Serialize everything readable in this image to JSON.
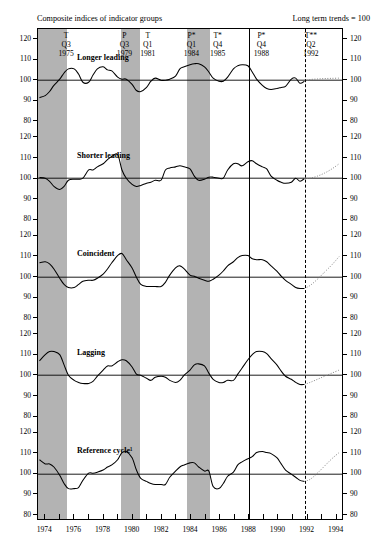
{
  "header": {
    "title_left": "Composite indices of indicator groups",
    "title_right": "Long term trends = 100"
  },
  "turning_points": [
    {
      "code": "T",
      "quarter": "Q3",
      "year": "1975",
      "x": 1975.5
    },
    {
      "code": "P",
      "quarter": "Q3",
      "year": "1979",
      "x": 1979.5
    },
    {
      "code": "T",
      "quarter": "Q1",
      "year": "1981",
      "x": 1981.1
    },
    {
      "code": "P*",
      "quarter": "Q1",
      "year": "1984",
      "x": 1984.1
    },
    {
      "code": "T*",
      "quarter": "Q4",
      "year": "1985",
      "x": 1985.9
    },
    {
      "code": "P*",
      "quarter": "Q4",
      "year": "1988",
      "x": 1988.9
    },
    {
      "code": "T**",
      "quarter": "Q2",
      "year": "1992",
      "x": 1992.3
    }
  ],
  "chart_data": {
    "type": "line",
    "title": "Composite indices of indicator groups",
    "subtitle": "Long term trends = 100",
    "xlabel": "",
    "ylabel": "",
    "xlim": [
      1973.5,
      1994.5
    ],
    "ylim": [
      80,
      120
    ],
    "yticks": [
      80,
      90,
      100,
      110,
      120
    ],
    "xticks": [
      1974,
      1975,
      1976,
      1977,
      1978,
      1979,
      1980,
      1981,
      1982,
      1983,
      1984,
      1985,
      1986,
      1987,
      1988,
      1989,
      1990,
      1991,
      1992,
      1993,
      1994
    ],
    "xtick_labels": [
      "1974",
      "1976",
      "1978",
      "1980",
      "1982",
      "1984",
      "1986",
      "1988",
      "1990",
      "1992",
      "1994"
    ],
    "xtick_label_values": [
      1974,
      1976,
      1978,
      1980,
      1982,
      1984,
      1986,
      1988,
      1990,
      1992,
      1994
    ],
    "grid": false,
    "reference_level": 100,
    "legend": "none",
    "recession_bands": [
      {
        "start": 1973.5,
        "end": 1975.5
      },
      {
        "start": 1979.2,
        "end": 1980.5
      },
      {
        "start": 1983.7,
        "end": 1985.3
      }
    ],
    "markers": {
      "solid_vline": 1988.0,
      "dashed_vline": 1991.85
    },
    "series": [
      {
        "name": "Longer leading",
        "x": [
          1973.6,
          1974.0,
          1974.3,
          1974.6,
          1975.0,
          1975.3,
          1975.6,
          1976.0,
          1976.3,
          1976.6,
          1977.0,
          1977.3,
          1977.6,
          1978.0,
          1978.3,
          1978.6,
          1979.0,
          1979.3,
          1979.6,
          1980.0,
          1980.3,
          1980.6,
          1981.0,
          1981.3,
          1981.6,
          1982.0,
          1982.3,
          1982.6,
          1983.0,
          1983.3,
          1983.6,
          1984.0,
          1984.3,
          1984.6,
          1985.0,
          1985.3,
          1985.6,
          1986.0,
          1986.3,
          1986.6,
          1987.0,
          1987.3,
          1987.6,
          1988.0,
          1988.3,
          1988.6,
          1989.0,
          1989.3,
          1989.6,
          1990.0,
          1990.3,
          1990.6,
          1991.0,
          1991.3,
          1991.6,
          1991.9
        ],
        "values": [
          91.5,
          92.5,
          94.5,
          97.5,
          100.5,
          103.5,
          105.5,
          105.5,
          103.0,
          99.0,
          99.0,
          102.5,
          105.5,
          106.5,
          105.0,
          104.5,
          101.5,
          100.5,
          100.5,
          98.0,
          95.0,
          94.5,
          96.5,
          99.5,
          101.0,
          100.0,
          100.0,
          100.5,
          102.0,
          105.5,
          106.5,
          107.5,
          108.0,
          108.0,
          106.5,
          104.0,
          101.0,
          99.5,
          99.5,
          101.5,
          105.5,
          107.0,
          107.5,
          107.0,
          104.0,
          100.5,
          97.5,
          96.0,
          95.5,
          96.0,
          96.5,
          97.0,
          100.5,
          101.0,
          98.5,
          99.5
        ],
        "projection_x": [
          1991.9,
          1992.3,
          1992.8,
          1993.3,
          1993.8,
          1994.3
        ],
        "projection_values": [
          99.5,
          100.3,
          100.6,
          100.8,
          100.9,
          101.0
        ],
        "panel": 0
      },
      {
        "name": "Shorter leading",
        "x": [
          1973.6,
          1974.0,
          1974.3,
          1974.6,
          1975.0,
          1975.3,
          1975.6,
          1976.0,
          1976.3,
          1976.6,
          1977.0,
          1977.3,
          1977.6,
          1978.0,
          1978.3,
          1978.6,
          1979.0,
          1979.3,
          1979.6,
          1980.0,
          1980.3,
          1980.6,
          1981.0,
          1981.3,
          1981.6,
          1982.0,
          1982.3,
          1982.6,
          1983.0,
          1983.3,
          1983.6,
          1984.0,
          1984.3,
          1984.6,
          1985.0,
          1985.3,
          1985.6,
          1986.0,
          1986.3,
          1986.6,
          1987.0,
          1987.3,
          1987.6,
          1988.0,
          1988.3,
          1988.6,
          1989.0,
          1989.3,
          1989.6,
          1990.0,
          1990.3,
          1990.6,
          1991.0,
          1991.3,
          1991.6,
          1991.9
        ],
        "values": [
          100.3,
          100.0,
          98.5,
          96.0,
          94.5,
          96.0,
          99.0,
          99.5,
          99.5,
          100.0,
          104.0,
          104.0,
          105.5,
          107.0,
          109.0,
          110.5,
          111.5,
          104.0,
          100.0,
          97.0,
          96.0,
          96.5,
          97.5,
          98.0,
          99.0,
          99.0,
          104.0,
          105.0,
          105.5,
          106.0,
          105.5,
          104.5,
          101.0,
          99.0,
          99.5,
          100.5,
          100.5,
          100.0,
          100.0,
          104.0,
          107.0,
          107.0,
          106.0,
          108.0,
          108.5,
          107.0,
          105.5,
          104.5,
          101.0,
          99.0,
          98.0,
          97.5,
          98.0,
          100.0,
          98.5,
          99.8
        ],
        "projection_x": [
          1991.9,
          1992.3,
          1992.8,
          1993.3,
          1993.8,
          1994.3
        ],
        "projection_values": [
          99.8,
          100.0,
          101.0,
          102.5,
          104.5,
          107.0
        ],
        "panel": 1
      },
      {
        "name": "Coincident",
        "x": [
          1973.6,
          1974.0,
          1974.3,
          1974.6,
          1975.0,
          1975.3,
          1975.6,
          1976.0,
          1976.3,
          1976.6,
          1977.0,
          1977.3,
          1977.6,
          1978.0,
          1978.3,
          1978.6,
          1979.0,
          1979.3,
          1979.6,
          1980.0,
          1980.3,
          1980.6,
          1981.0,
          1981.3,
          1981.6,
          1982.0,
          1982.3,
          1982.6,
          1983.0,
          1983.3,
          1983.6,
          1984.0,
          1984.3,
          1984.6,
          1985.0,
          1985.3,
          1985.6,
          1986.0,
          1986.3,
          1986.6,
          1987.0,
          1987.3,
          1987.6,
          1988.0,
          1988.3,
          1988.6,
          1989.0,
          1989.3,
          1989.6,
          1990.0,
          1990.3,
          1990.6,
          1991.0,
          1991.3,
          1991.6,
          1991.9
        ],
        "values": [
          107.0,
          107.5,
          106.5,
          104.0,
          99.5,
          96.5,
          95.0,
          95.0,
          96.5,
          98.0,
          98.5,
          98.5,
          99.5,
          101.5,
          104.0,
          107.0,
          110.5,
          111.5,
          108.5,
          104.5,
          100.0,
          96.5,
          95.5,
          95.5,
          95.5,
          95.5,
          97.5,
          101.0,
          104.5,
          105.5,
          104.0,
          101.0,
          100.5,
          99.5,
          98.5,
          98.0,
          99.0,
          101.0,
          103.0,
          105.5,
          107.5,
          109.5,
          110.5,
          110.5,
          109.0,
          108.5,
          108.5,
          107.5,
          105.5,
          103.0,
          100.5,
          98.5,
          96.5,
          95.0,
          94.5,
          94.5
        ],
        "projection_x": [
          1991.9,
          1992.3,
          1992.8,
          1993.3,
          1993.8,
          1994.3
        ],
        "projection_values": [
          94.5,
          96.0,
          99.0,
          102.5,
          106.0,
          110.0
        ],
        "panel": 2
      },
      {
        "name": "Lagging",
        "x": [
          1973.6,
          1974.0,
          1974.3,
          1974.6,
          1975.0,
          1975.3,
          1975.6,
          1976.0,
          1976.3,
          1976.6,
          1977.0,
          1977.3,
          1977.6,
          1978.0,
          1978.3,
          1978.6,
          1979.0,
          1979.3,
          1979.6,
          1980.0,
          1980.3,
          1980.6,
          1981.0,
          1981.3,
          1981.6,
          1982.0,
          1982.3,
          1982.6,
          1983.0,
          1983.3,
          1983.6,
          1984.0,
          1984.3,
          1984.6,
          1985.0,
          1985.3,
          1985.6,
          1986.0,
          1986.3,
          1986.6,
          1987.0,
          1987.3,
          1987.6,
          1988.0,
          1988.3,
          1988.6,
          1989.0,
          1989.3,
          1989.6,
          1990.0,
          1990.3,
          1990.6,
          1991.0,
          1991.3,
          1991.6,
          1991.9
        ],
        "values": [
          107.0,
          110.0,
          111.5,
          111.5,
          110.0,
          105.0,
          100.0,
          97.5,
          96.5,
          96.0,
          96.0,
          97.0,
          99.5,
          102.5,
          104.5,
          104.5,
          106.5,
          107.5,
          107.0,
          104.0,
          100.5,
          100.0,
          98.5,
          97.5,
          99.0,
          99.5,
          99.0,
          97.5,
          96.5,
          97.5,
          100.0,
          102.5,
          105.0,
          105.5,
          104.5,
          101.0,
          98.0,
          96.5,
          96.5,
          97.5,
          97.5,
          100.5,
          103.5,
          107.5,
          110.0,
          111.5,
          111.5,
          110.5,
          108.0,
          105.0,
          102.0,
          99.5,
          98.0,
          96.5,
          95.5,
          95.5
        ],
        "projection_x": [
          1991.9,
          1992.3,
          1992.8,
          1993.3,
          1993.8,
          1994.3
        ],
        "projection_values": [
          95.5,
          96.5,
          98.0,
          99.5,
          101.0,
          102.5
        ],
        "panel": 3
      },
      {
        "name": "Reference cycle¹",
        "x": [
          1973.6,
          1974.0,
          1974.3,
          1974.6,
          1975.0,
          1975.3,
          1975.6,
          1976.0,
          1976.3,
          1976.6,
          1977.0,
          1977.3,
          1977.6,
          1978.0,
          1978.3,
          1978.6,
          1979.0,
          1979.3,
          1979.6,
          1980.0,
          1980.3,
          1980.6,
          1981.0,
          1981.3,
          1981.6,
          1982.0,
          1982.3,
          1982.6,
          1983.0,
          1983.3,
          1983.6,
          1984.0,
          1984.3,
          1984.6,
          1985.0,
          1985.3,
          1985.6,
          1986.0,
          1986.3,
          1986.6,
          1987.0,
          1987.3,
          1987.6,
          1988.0,
          1988.3,
          1988.6,
          1989.0,
          1989.3,
          1989.6,
          1990.0,
          1990.3,
          1990.6,
          1991.0,
          1991.3,
          1991.6,
          1991.9
        ],
        "values": [
          107.0,
          105.0,
          105.0,
          103.5,
          99.5,
          95.5,
          93.0,
          93.0,
          93.5,
          97.0,
          100.5,
          100.5,
          101.0,
          102.0,
          103.5,
          104.5,
          107.0,
          110.5,
          111.0,
          108.0,
          102.0,
          98.0,
          96.5,
          95.5,
          95.0,
          95.0,
          95.0,
          98.5,
          101.5,
          103.5,
          104.5,
          105.5,
          105.5,
          103.5,
          101.5,
          101.5,
          94.0,
          93.0,
          95.5,
          99.0,
          101.0,
          104.5,
          106.0,
          107.5,
          108.5,
          110.5,
          111.0,
          110.5,
          110.0,
          108.0,
          105.0,
          102.0,
          100.0,
          98.5,
          97.0,
          96.5
        ],
        "projection_x": [
          1991.9,
          1992.3,
          1992.8,
          1993.3,
          1993.8,
          1994.3
        ],
        "projection_values": [
          96.5,
          97.5,
          100.5,
          104.0,
          107.5,
          110.5
        ],
        "panel": 4
      }
    ]
  },
  "axis": {
    "ytick_labels": [
      "120",
      "110",
      "100",
      "90",
      "80"
    ],
    "xtick_labels": [
      "1974",
      "1976",
      "1978",
      "1980",
      "1982",
      "1984",
      "1986",
      "1988",
      "1990",
      "1992",
      "1994"
    ]
  }
}
